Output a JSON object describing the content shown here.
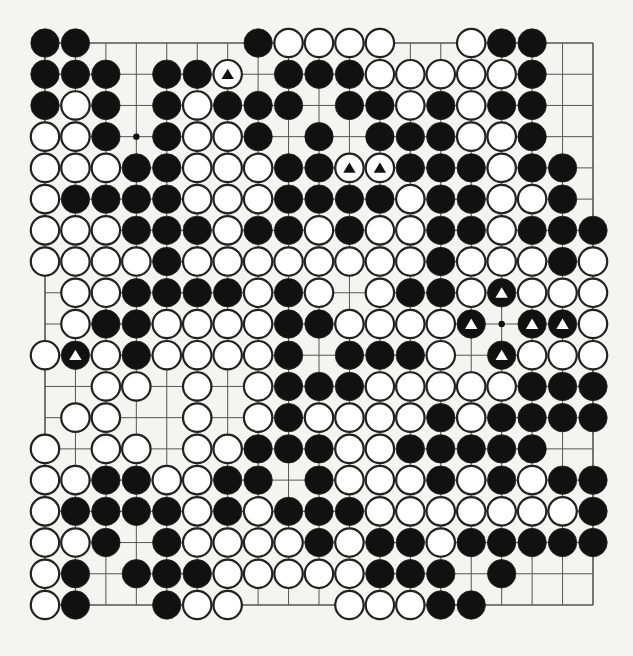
{
  "diagram": {
    "type": "go-board",
    "size": 19,
    "legend": {
      "B": "black stone",
      "W": "white stone",
      ".": "empty point",
      "b": "black stone marked with triangle",
      "w": "white stone marked with triangle"
    },
    "colors": {
      "background": "#f4f4f2",
      "line": "#555555",
      "black": "#111111",
      "white": "#ffffff",
      "stroke": "#222222"
    },
    "star_points": [
      [
        3,
        3
      ],
      [
        9,
        15
      ]
    ],
    "rows": [
      "BB.....BWWWW..WBB..",
      "BBB.BBw.BBBWWWWWB..",
      "BWB.BWBBB.BBWBWBB..",
      "WWB.BWWB.B.BBBWWB..",
      "WWWBBWWWBBwwBBBWBB.",
      "WBBBBWWWBBBBWBBWWB.",
      "WWWBBBWBBWBWWBBWBBB",
      "WWWWBWWWWWWWWBWWWBW",
      ".WWBBBBWBW.WBBWbWWW",
      ".WBBWWWWBBWWWWb.bbW",
      "WbWBWWWWB.BBBW.bWWW",
      "..WW.W.WBBBWWWWWBBB",
      ".WW..W.WBWWWWBWBBBB",
      "W.WW.WWBBBWWBBBBB..",
      "WWBBWWBB.BWWWBWBWBB",
      "WBBBBWBWBBBWWWWWWWB",
      "WWB.BWWWWBWBBWBBBBB",
      "WB.BBBWWWWWBBB.B...",
      "WB..BWW...WWWBB...."
    ]
  }
}
